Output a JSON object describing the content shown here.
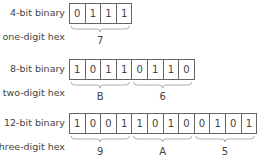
{
  "rows": [
    {
      "binary_label": "4-bit binary",
      "hex_label": "one-digit hex",
      "bits": [
        "0",
        "1",
        "1",
        "1"
      ],
      "hex_digits": [
        "7"
      ]
    },
    {
      "binary_label": "8-bit binary",
      "hex_label": "two-digit hex",
      "bits": [
        "1",
        "0",
        "1",
        "1",
        "0",
        "1",
        "1",
        "0"
      ],
      "hex_digits": [
        "B",
        "6"
      ]
    },
    {
      "binary_label": "12-bit binary",
      "hex_label": "three-digit hex",
      "bits": [
        "1",
        "0",
        "0",
        "1",
        "1",
        "0",
        "1",
        "0",
        "0",
        "1",
        "0",
        "1"
      ],
      "hex_digits": [
        "9",
        "A",
        "5"
      ]
    }
  ]
}
